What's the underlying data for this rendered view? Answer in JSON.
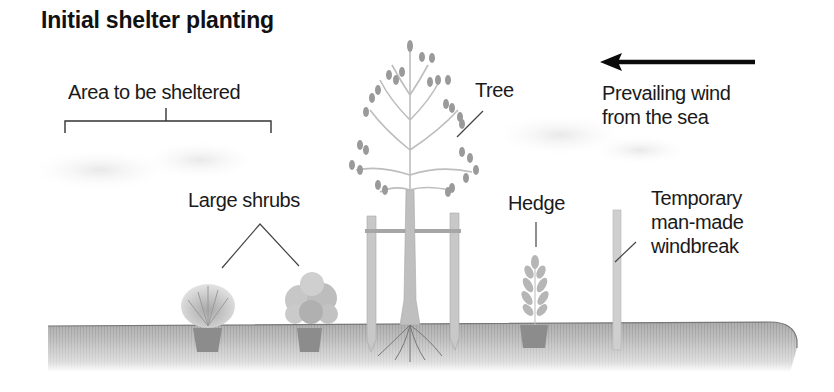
{
  "title": "Initial shelter planting",
  "labels": {
    "area": "Area to be sheltered",
    "tree": "Tree",
    "wind": [
      "Prevailing wind",
      "from the sea"
    ],
    "shrubs": "Large shrubs",
    "hedge": "Hedge",
    "windbreak": [
      "Temporary",
      "man-made",
      "windbreak"
    ]
  },
  "wind_direction": "right-to-left",
  "colors": {
    "background": "#ffffff",
    "text": "#1a1a1a",
    "leader_lines": "#444444",
    "ground": "#a9a9a9",
    "foliage": "#9a9a9a",
    "pot": "#8c8c8c",
    "stake": "#c8c8c8",
    "arrow": "#0a0a0a"
  }
}
